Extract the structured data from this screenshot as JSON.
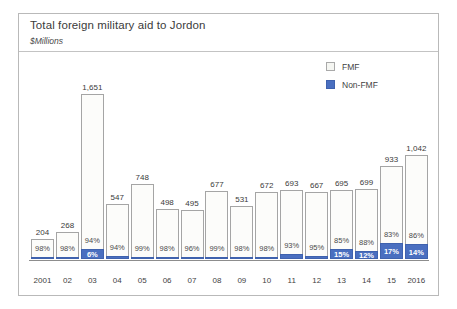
{
  "chart_data": {
    "type": "bar",
    "title": "Total foreign military aid to Jordon",
    "subtitle": "$Millions",
    "xlabel": "",
    "ylabel": "$Millions",
    "grid": false,
    "legend_position": "top-right",
    "stacked": true,
    "ylim": [
      0,
      1651
    ],
    "categories": [
      "2001",
      "02",
      "03",
      "04",
      "05",
      "06",
      "07",
      "08",
      "09",
      "10",
      "11",
      "12",
      "13",
      "14",
      "15",
      "2016"
    ],
    "totals": [
      204,
      268,
      1651,
      547,
      748,
      498,
      495,
      677,
      531,
      672,
      693,
      667,
      695,
      699,
      933,
      1042
    ],
    "total_labels": [
      "204",
      "268",
      "1,651",
      "547",
      "748",
      "498",
      "495",
      "677",
      "531",
      "672",
      "693",
      "667",
      "695",
      "699",
      "933",
      "1,042"
    ],
    "series": [
      {
        "name": "FMF",
        "color": "#fcfcfa",
        "percent_labels": [
          "98%",
          "98%",
          "94%",
          "94%",
          "99%",
          "98%",
          "96%",
          "99%",
          "98%",
          "98%",
          "93%",
          "95%",
          "85%",
          "88%",
          "83%",
          "86%"
        ],
        "percents": [
          98,
          98,
          94,
          94,
          99,
          98,
          96,
          99,
          98,
          98,
          93,
          95,
          85,
          88,
          83,
          86
        ]
      },
      {
        "name": "Non-FMF",
        "color": "#4a6fc0",
        "percent_labels": [
          "2%",
          "2%",
          "6%",
          "6%",
          "1%",
          "2%",
          "4%",
          "1%",
          "2%",
          "2%",
          "7%",
          "5%",
          "15%",
          "12%",
          "17%",
          "14%"
        ],
        "percents": [
          2,
          2,
          6,
          6,
          1,
          2,
          4,
          1,
          2,
          2,
          7,
          5,
          15,
          12,
          17,
          14
        ],
        "visible_labels": [
          false,
          false,
          true,
          false,
          false,
          false,
          false,
          false,
          false,
          false,
          false,
          false,
          true,
          true,
          true,
          true
        ]
      }
    ]
  },
  "legend": {
    "items": [
      {
        "label": "FMF"
      },
      {
        "label": "Non-FMF"
      }
    ]
  },
  "colors": {
    "non_fmf": "#4a6fc0",
    "fmf_fill": "#fcfcfa",
    "bar_border": "#a5a5a5",
    "frame_border": "#b9b9b9",
    "axis": "#8d8d8d"
  }
}
